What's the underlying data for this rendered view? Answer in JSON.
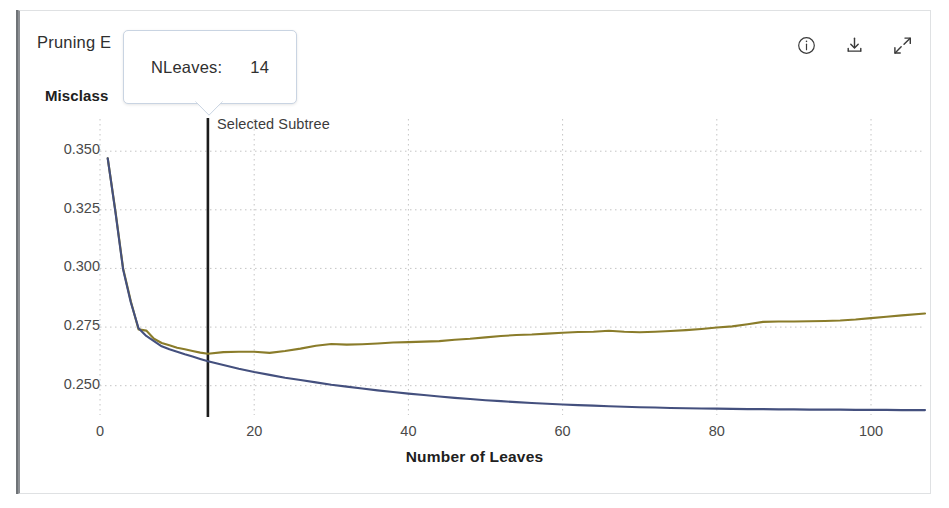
{
  "window": {
    "accent_border": "#8d9094",
    "card_border": "#dfe1e3"
  },
  "header": {
    "chart_title": "Pruning E",
    "chart_title_full": "Pruning Error",
    "y_axis_title": "Misclass",
    "y_axis_title_full": "Misclassification Rate"
  },
  "toolbar": {
    "items": [
      {
        "name": "info-icon",
        "label": "Info"
      },
      {
        "name": "download-icon",
        "label": "Download"
      },
      {
        "name": "expand-icon",
        "label": "Expand"
      }
    ]
  },
  "tooltip": {
    "label": "NLeaves:",
    "value": "14",
    "border_color": "#c9d4e2"
  },
  "annotations": {
    "selected_subtree": "Selected Subtree",
    "selected_subtree_x": 14,
    "marker_color": "#1c1c1c"
  },
  "chart_data": {
    "type": "line",
    "xlabel": "Number of Leaves",
    "ylabel": "Misclassification Rate",
    "xlim": [
      0,
      107
    ],
    "ylim": [
      0.2375,
      0.3535
    ],
    "grid": true,
    "legend": "none",
    "xticks": [
      0,
      20,
      40,
      60,
      80,
      100
    ],
    "ytick_labels": [
      "0.350",
      "0.325",
      "0.300",
      "0.275",
      "0.250"
    ],
    "yticks": [
      0.35,
      0.325,
      0.3,
      0.275,
      0.25
    ],
    "series": [
      {
        "name": "Cross-validated error",
        "color": "#8a7c2a",
        "width": 2.1,
        "points": [
          [
            1,
            0.347
          ],
          [
            2,
            0.3245
          ],
          [
            3,
            0.3
          ],
          [
            4,
            0.286
          ],
          [
            5,
            0.274
          ],
          [
            6,
            0.2735
          ],
          [
            7,
            0.27
          ],
          [
            8,
            0.2682
          ],
          [
            9,
            0.2672
          ],
          [
            10,
            0.2662
          ],
          [
            11,
            0.2655
          ],
          [
            12,
            0.2648
          ],
          [
            13,
            0.2641
          ],
          [
            14,
            0.2636
          ],
          [
            16,
            0.2643
          ],
          [
            18,
            0.2645
          ],
          [
            20,
            0.2645
          ],
          [
            22,
            0.264
          ],
          [
            24,
            0.2648
          ],
          [
            26,
            0.2658
          ],
          [
            28,
            0.267
          ],
          [
            30,
            0.2678
          ],
          [
            32,
            0.2675
          ],
          [
            34,
            0.2677
          ],
          [
            36,
            0.268
          ],
          [
            38,
            0.2684
          ],
          [
            40,
            0.2686
          ],
          [
            42,
            0.2688
          ],
          [
            44,
            0.269
          ],
          [
            46,
            0.2696
          ],
          [
            48,
            0.27
          ],
          [
            50,
            0.2706
          ],
          [
            52,
            0.2712
          ],
          [
            54,
            0.2716
          ],
          [
            56,
            0.2718
          ],
          [
            58,
            0.2722
          ],
          [
            60,
            0.2726
          ],
          [
            62,
            0.2729
          ],
          [
            64,
            0.273
          ],
          [
            66,
            0.2734
          ],
          [
            68,
            0.273
          ],
          [
            70,
            0.2728
          ],
          [
            72,
            0.273
          ],
          [
            74,
            0.2733
          ],
          [
            76,
            0.2737
          ],
          [
            78,
            0.2742
          ],
          [
            80,
            0.2748
          ],
          [
            82,
            0.2753
          ],
          [
            84,
            0.2762
          ],
          [
            86,
            0.2772
          ],
          [
            88,
            0.2774
          ],
          [
            90,
            0.2774
          ],
          [
            92,
            0.2775
          ],
          [
            94,
            0.2776
          ],
          [
            96,
            0.2778
          ],
          [
            98,
            0.2782
          ],
          [
            100,
            0.2788
          ],
          [
            102,
            0.2794
          ],
          [
            104,
            0.28
          ],
          [
            107,
            0.2808
          ]
        ]
      },
      {
        "name": "Resubstitution error",
        "color": "#44507e",
        "width": 2.1,
        "points": [
          [
            1,
            0.347
          ],
          [
            2,
            0.324
          ],
          [
            3,
            0.2995
          ],
          [
            4,
            0.2855
          ],
          [
            5,
            0.2745
          ],
          [
            6,
            0.2712
          ],
          [
            7,
            0.269
          ],
          [
            8,
            0.2668
          ],
          [
            9,
            0.2655
          ],
          [
            10,
            0.2645
          ],
          [
            11,
            0.2634
          ],
          [
            12,
            0.2624
          ],
          [
            13,
            0.2614
          ],
          [
            14,
            0.2604
          ],
          [
            16,
            0.2588
          ],
          [
            18,
            0.2572
          ],
          [
            20,
            0.2558
          ],
          [
            22,
            0.2546
          ],
          [
            24,
            0.2534
          ],
          [
            26,
            0.2524
          ],
          [
            28,
            0.2514
          ],
          [
            30,
            0.2504
          ],
          [
            32,
            0.2496
          ],
          [
            34,
            0.2488
          ],
          [
            36,
            0.248
          ],
          [
            38,
            0.2473
          ],
          [
            40,
            0.2466
          ],
          [
            42,
            0.246
          ],
          [
            44,
            0.2454
          ],
          [
            46,
            0.2448
          ],
          [
            48,
            0.2443
          ],
          [
            50,
            0.2438
          ],
          [
            52,
            0.2434
          ],
          [
            54,
            0.243
          ],
          [
            56,
            0.2426
          ],
          [
            58,
            0.2423
          ],
          [
            60,
            0.242
          ],
          [
            62,
            0.2417
          ],
          [
            64,
            0.2415
          ],
          [
            66,
            0.2412
          ],
          [
            68,
            0.241
          ],
          [
            70,
            0.2408
          ],
          [
            72,
            0.2407
          ],
          [
            74,
            0.2405
          ],
          [
            76,
            0.2404
          ],
          [
            78,
            0.2403
          ],
          [
            80,
            0.2402
          ],
          [
            82,
            0.2401
          ],
          [
            84,
            0.24
          ],
          [
            86,
            0.24
          ],
          [
            88,
            0.2399
          ],
          [
            90,
            0.2399
          ],
          [
            92,
            0.2398
          ],
          [
            94,
            0.2398
          ],
          [
            96,
            0.2398
          ],
          [
            98,
            0.2397
          ],
          [
            100,
            0.2397
          ],
          [
            102,
            0.2397
          ],
          [
            104,
            0.2396
          ],
          [
            107,
            0.2396
          ]
        ]
      }
    ]
  }
}
